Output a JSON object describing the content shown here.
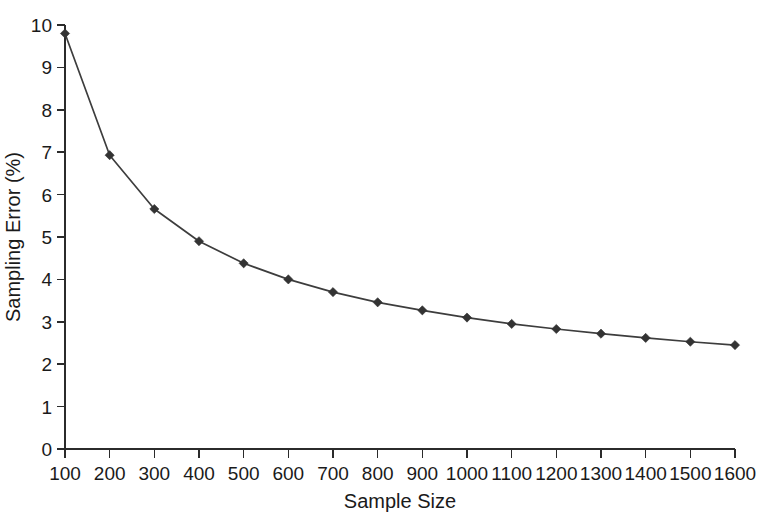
{
  "chart_data": {
    "type": "line",
    "title": "",
    "xlabel": "Sample Size",
    "ylabel": "Sampling Error (%)",
    "x": [
      100,
      200,
      300,
      400,
      500,
      600,
      700,
      800,
      900,
      1000,
      1100,
      1200,
      1300,
      1400,
      1500,
      1600
    ],
    "values": [
      9.8,
      6.93,
      5.66,
      4.9,
      4.38,
      4.0,
      3.7,
      3.46,
      3.27,
      3.1,
      2.95,
      2.83,
      2.72,
      2.62,
      2.53,
      2.45
    ],
    "series": [
      {
        "name": "Sampling Error",
        "values": [
          9.8,
          6.93,
          5.66,
          4.9,
          4.38,
          4.0,
          3.7,
          3.46,
          3.27,
          3.1,
          2.95,
          2.83,
          2.72,
          2.62,
          2.53,
          2.45
        ]
      }
    ],
    "xtick_labels": [
      "100",
      "200",
      "300",
      "400",
      "500",
      "600",
      "700",
      "800",
      "900",
      "1000",
      "1100",
      "1200",
      "1300",
      "1400",
      "1500",
      "1600"
    ],
    "ytick_labels": [
      "0",
      "1",
      "2",
      "3",
      "4",
      "5",
      "6",
      "7",
      "8",
      "9",
      "10"
    ],
    "yticks": [
      0,
      1,
      2,
      3,
      4,
      5,
      6,
      7,
      8,
      9,
      10
    ],
    "ylim": [
      0,
      10
    ],
    "xlim": [
      100,
      1600
    ],
    "grid": false,
    "legend": false,
    "marker": "diamond",
    "line_color": "#3d3d3d",
    "marker_color": "#333333",
    "axis_color": "#2b2b2b",
    "background_color": "#ffffff"
  }
}
